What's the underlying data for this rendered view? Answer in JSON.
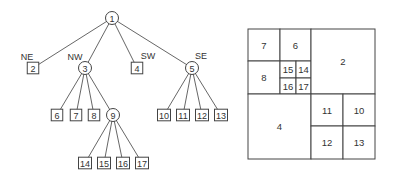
{
  "tree": {
    "root": {
      "id": "1",
      "label": "1",
      "shape": "circle",
      "x": 112,
      "y": 18
    },
    "edge_labels": [
      {
        "text": "NE",
        "x": 27,
        "y": 57
      },
      {
        "text": "NW",
        "x": 75,
        "y": 57
      },
      {
        "text": "SW",
        "x": 148,
        "y": 56
      },
      {
        "text": "SE",
        "x": 201,
        "y": 56
      }
    ],
    "nodes": [
      {
        "id": "2",
        "label": "2",
        "shape": "box",
        "x": 33,
        "y": 68,
        "parent": "1"
      },
      {
        "id": "3",
        "label": "3",
        "shape": "circle",
        "x": 85,
        "y": 68,
        "parent": "1"
      },
      {
        "id": "4",
        "label": "4",
        "shape": "box",
        "x": 137,
        "y": 68,
        "parent": "1"
      },
      {
        "id": "5",
        "label": "5",
        "shape": "circle",
        "x": 192,
        "y": 68,
        "parent": "1"
      },
      {
        "id": "6",
        "label": "6",
        "shape": "box",
        "x": 57,
        "y": 115,
        "parent": "3"
      },
      {
        "id": "7",
        "label": "7",
        "shape": "box",
        "x": 76,
        "y": 115,
        "parent": "3"
      },
      {
        "id": "8",
        "label": "8",
        "shape": "box",
        "x": 94,
        "y": 115,
        "parent": "3"
      },
      {
        "id": "9",
        "label": "9",
        "shape": "circle",
        "x": 113,
        "y": 115,
        "parent": "3"
      },
      {
        "id": "10",
        "label": "10",
        "shape": "box",
        "x": 164,
        "y": 115,
        "parent": "5"
      },
      {
        "id": "11",
        "label": "11",
        "shape": "box",
        "x": 183,
        "y": 115,
        "parent": "5"
      },
      {
        "id": "12",
        "label": "12",
        "shape": "box",
        "x": 202,
        "y": 115,
        "parent": "5"
      },
      {
        "id": "13",
        "label": "13",
        "shape": "box",
        "x": 221,
        "y": 115,
        "parent": "5"
      },
      {
        "id": "14",
        "label": "14",
        "shape": "box",
        "x": 85,
        "y": 163,
        "parent": "9"
      },
      {
        "id": "15",
        "label": "15",
        "shape": "box",
        "x": 104,
        "y": 163,
        "parent": "9"
      },
      {
        "id": "16",
        "label": "16",
        "shape": "box",
        "x": 123,
        "y": 163,
        "parent": "9"
      },
      {
        "id": "17",
        "label": "17",
        "shape": "box",
        "x": 142,
        "y": 163,
        "parent": "9"
      }
    ]
  },
  "quadtree": {
    "cells": [
      {
        "label": "7",
        "x": 248,
        "y": 29,
        "w": 32,
        "h": 32
      },
      {
        "label": "6",
        "x": 280,
        "y": 29,
        "w": 31,
        "h": 32
      },
      {
        "label": "8",
        "x": 248,
        "y": 61,
        "w": 32,
        "h": 33
      },
      {
        "label": "15",
        "x": 280,
        "y": 61,
        "w": 16,
        "h": 17
      },
      {
        "label": "14",
        "x": 296,
        "y": 61,
        "w": 15,
        "h": 17
      },
      {
        "label": "16",
        "x": 280,
        "y": 78,
        "w": 16,
        "h": 16
      },
      {
        "label": "17",
        "x": 296,
        "y": 78,
        "w": 15,
        "h": 16
      },
      {
        "label": "2",
        "x": 311,
        "y": 29,
        "w": 64,
        "h": 65
      },
      {
        "label": "4",
        "x": 248,
        "y": 94,
        "w": 63,
        "h": 65
      },
      {
        "label": "11",
        "x": 311,
        "y": 94,
        "w": 32,
        "h": 32
      },
      {
        "label": "10",
        "x": 343,
        "y": 94,
        "w": 32,
        "h": 32
      },
      {
        "label": "12",
        "x": 311,
        "y": 126,
        "w": 32,
        "h": 33
      },
      {
        "label": "13",
        "x": 343,
        "y": 126,
        "w": 32,
        "h": 33
      }
    ]
  }
}
